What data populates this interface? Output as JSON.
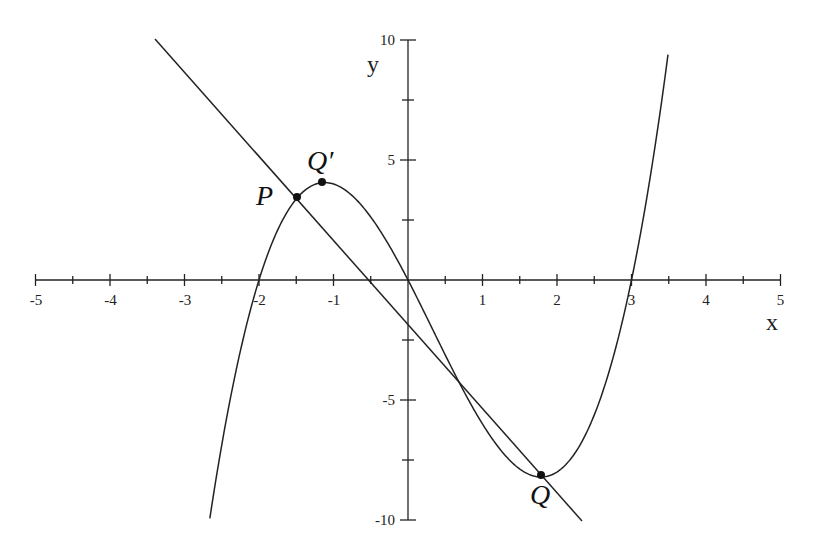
{
  "chart_data": {
    "type": "line",
    "title": "",
    "xlabel": "x",
    "ylabel": "y",
    "xlim": [
      -5,
      5
    ],
    "ylim": [
      -10,
      10
    ],
    "grid": false,
    "x_ticks": [
      -5,
      -4,
      -3,
      -2,
      -1,
      1,
      2,
      3,
      4,
      5
    ],
    "y_ticks": [
      10,
      5,
      -5,
      -10
    ],
    "x_minor_step": 0.5,
    "y_minor_step": 2.5,
    "series": [
      {
        "name": "cubic curve",
        "equation": "y = x^3 - x^2 - 6x",
        "domain": [
          -2.66,
          3.49
        ],
        "roots": [
          -2,
          0,
          3
        ]
      },
      {
        "name": "straight line",
        "equation": "y = -3.5x - 1.9",
        "domain": [
          -3.4,
          2.34
        ]
      }
    ],
    "points": [
      {
        "label": "P",
        "x": -1.49,
        "y": 3.46
      },
      {
        "label": "Q′",
        "x": -1.15,
        "y": 4.06
      },
      {
        "label": "Q",
        "x": 1.79,
        "y": -8.21
      }
    ]
  },
  "labels": {
    "x_axis": "x",
    "y_axis": "y",
    "P": "P",
    "Qprime": "Q′",
    "Q": "Q",
    "xt": {
      "m5": "-5",
      "m4": "-4",
      "m3": "-3",
      "m2": "-2",
      "m1": "-1",
      "p1": "1",
      "p2": "2",
      "p3": "3",
      "p4": "4",
      "p5": "5"
    },
    "yt": {
      "p10": "10",
      "p5": "5",
      "m5": "-5",
      "m10": "-10"
    }
  }
}
